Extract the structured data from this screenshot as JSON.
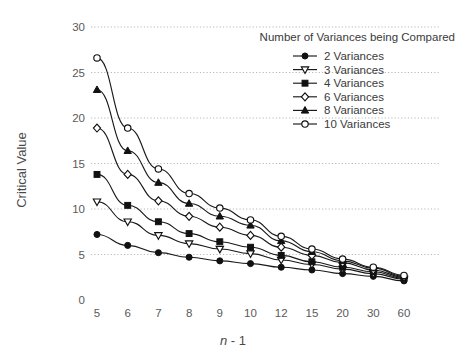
{
  "chart_data": {
    "type": "line",
    "title": "",
    "xlabel": "n - 1",
    "xlabel_italic_part": "n",
    "xlabel_rest": " - 1",
    "ylabel": "Critical Value",
    "categories": [
      "5",
      "6",
      "7",
      "8",
      "9",
      "10",
      "12",
      "15",
      "20",
      "30",
      "60"
    ],
    "ylim": [
      0,
      30
    ],
    "yticks": [
      "0",
      "5",
      "10",
      "15",
      "20",
      "25",
      "30"
    ],
    "grid": true,
    "legend_position": "top-right",
    "legend_title": "Number of Variances being Compared",
    "series": [
      {
        "name": "2 Variances",
        "marker": "circle-filled",
        "values": [
          7.2,
          6.0,
          5.2,
          4.7,
          4.3,
          4.0,
          3.6,
          3.3,
          2.9,
          2.6,
          2.1
        ]
      },
      {
        "name": "3 Variances",
        "marker": "triangle-down-open",
        "values": [
          10.8,
          8.6,
          7.1,
          6.2,
          5.6,
          5.1,
          4.4,
          3.9,
          3.4,
          2.9,
          2.3
        ]
      },
      {
        "name": "4 Variances",
        "marker": "square-filled",
        "values": [
          13.8,
          10.4,
          8.6,
          7.3,
          6.4,
          5.8,
          4.9,
          4.2,
          3.6,
          3.1,
          2.4
        ]
      },
      {
        "name": "6 Variances",
        "marker": "diamond-open",
        "values": [
          18.9,
          13.8,
          10.9,
          9.2,
          8.0,
          7.1,
          5.8,
          4.9,
          4.1,
          3.3,
          2.5
        ]
      },
      {
        "name": "8 Variances",
        "marker": "triangle-up-filled",
        "values": [
          23.1,
          16.4,
          12.9,
          10.6,
          9.2,
          8.2,
          6.5,
          5.3,
          4.3,
          3.5,
          2.6
        ]
      },
      {
        "name": "10 Variances",
        "marker": "circle-open",
        "values": [
          26.6,
          18.9,
          14.4,
          11.7,
          10.1,
          8.8,
          7.0,
          5.6,
          4.5,
          3.6,
          2.7
        ]
      }
    ]
  },
  "colors": {
    "line": "#111111",
    "grid": "#b8b8b8",
    "text": "#3a3a3a",
    "background": "#ffffff"
  }
}
